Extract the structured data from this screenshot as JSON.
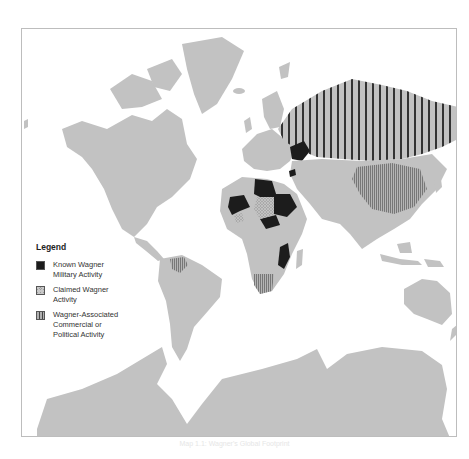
{
  "map": {
    "title": "Wagner Group Global Footprint",
    "colors": {
      "land": "#c2c2c2",
      "water": "#ffffff",
      "known_military": "#1c1c1c",
      "claimed": "#9a9a9a",
      "associated_stripe": "#444444",
      "frame": "#bdbdbd"
    },
    "regions": {
      "known_military": [
        "Ukraine",
        "Libya",
        "Sudan",
        "Mali",
        "Central African Republic",
        "Mozambique",
        "Syria"
      ],
      "claimed": [
        "Chad area",
        "Burkina Faso area"
      ],
      "associated": [
        "Russia",
        "China",
        "Venezuela",
        "South Africa",
        "Madagascar"
      ]
    }
  },
  "legend": {
    "title": "Legend",
    "items": [
      {
        "label": "Known Wagner Military Activity",
        "line1": "Known Wagner",
        "line2": "Military Activity",
        "icon": "solid-black-swatch"
      },
      {
        "label": "Claimed Wagner Activity",
        "line1": "Claimed Wagner",
        "line2": "Activity",
        "icon": "crosshatch-swatch"
      },
      {
        "label": "Wagner-Associated Commercial or Political Activity",
        "line1": "Wagner-Associated",
        "line2": "Commercial or",
        "line3": "Political Activity",
        "icon": "vertical-stripe-swatch"
      }
    ]
  },
  "caption": "Map 1.1: Wagner's Global Footprint"
}
